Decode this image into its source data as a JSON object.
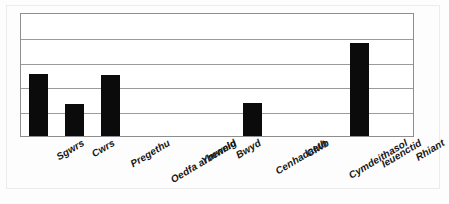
{
  "chart_data": {
    "type": "bar",
    "title": "",
    "subtitle": "",
    "xlabel": "",
    "ylabel": "",
    "categories": [
      "Sgwrs",
      "Cwrs",
      "Pregethu",
      "Oedfa arbennig",
      "Ymweld",
      "Bwyd",
      "Cenhadaeth",
      "Clwb",
      "Cymdeithasol",
      "Ieuenctid",
      "Rhiant"
    ],
    "values": [
      50,
      26,
      49,
      0,
      0,
      0,
      27,
      0,
      0,
      75,
      0
    ],
    "ylim": [
      0,
      100
    ],
    "yticks": [
      0,
      20,
      40,
      60,
      80,
      100
    ],
    "ytick_labels": [
      "",
      "",
      "",
      "",
      "",
      ""
    ],
    "grid": true,
    "grid_axis": "y",
    "legend": false,
    "legend_position": "none",
    "bar_color": "#0b0b0b",
    "grid_color": "#9b9b9d",
    "frame_color": "#8e8e90",
    "background_color": "#ffffff",
    "annotations": []
  },
  "figure": {
    "name": "bar-chart",
    "axis_label_rotation": "-31deg"
  }
}
